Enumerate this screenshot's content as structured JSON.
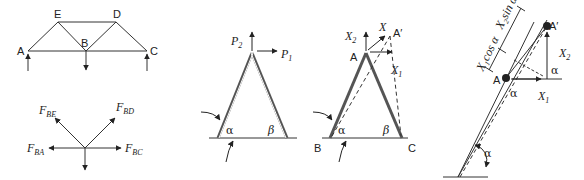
{
  "figure": {
    "colors": {
      "line": "#333333",
      "member": "#555555",
      "background": "#ffffff"
    },
    "truss": {
      "nodes": {
        "A": "A",
        "B": "B",
        "C": "C",
        "D": "D",
        "E": "E"
      }
    },
    "free_body": {
      "forces": {
        "BE": {
          "main": "F",
          "sub": "BE"
        },
        "BD": {
          "main": "F",
          "sub": "BD"
        },
        "BA": {
          "main": "F",
          "sub": "BA"
        },
        "BC": {
          "main": "F",
          "sub": "BC"
        }
      }
    },
    "frame_loads": {
      "p2": {
        "main": "P",
        "sub": "2"
      },
      "p1": {
        "main": "P",
        "sub": "1"
      },
      "alpha": "α",
      "beta": "β"
    },
    "frame_displacement": {
      "x2": {
        "main": "X",
        "sub": "2"
      },
      "x": "X",
      "a_prime": "A′",
      "a": "A",
      "x1": {
        "main": "X",
        "sub": "1"
      },
      "alpha": "α",
      "beta": "β",
      "b": "B",
      "c": "C"
    },
    "detail": {
      "x1cos": "X₁cos α",
      "x2sin": "X₂sin α",
      "a_prime": "A′",
      "a": "A",
      "x2": {
        "main": "X",
        "sub": "2"
      },
      "x1": {
        "main": "X",
        "sub": "1"
      },
      "alpha_top": "α",
      "alpha_mid": "α",
      "alpha_base": "α"
    }
  }
}
